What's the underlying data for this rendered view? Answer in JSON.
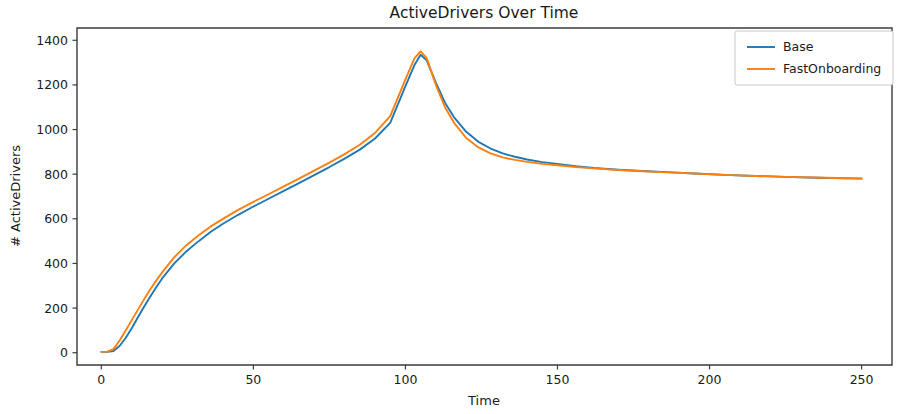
{
  "chart_data": {
    "type": "line",
    "title": "ActiveDrivers Over Time",
    "xlabel": "Time",
    "ylabel": "# ActiveDrivers",
    "xlim": [
      -8,
      260
    ],
    "ylim": [
      -55,
      1455
    ],
    "xticks": [
      0,
      50,
      100,
      150,
      200,
      250
    ],
    "xticklabels": [
      "0",
      "50",
      "100",
      "150",
      "200",
      "250"
    ],
    "yticks": [
      0,
      200,
      400,
      600,
      800,
      1000,
      1200,
      1400
    ],
    "yticklabels": [
      "0",
      "200",
      "400",
      "600",
      "800",
      "1000",
      "1200",
      "1400"
    ],
    "grid": false,
    "legend_position": "upper right",
    "legend_entries": [
      "Base",
      "FastOnboarding"
    ],
    "colors": {
      "Base": "#1f77b4",
      "FastOnboarding": "#ff7f0e"
    },
    "x": [
      0,
      2,
      4,
      6,
      8,
      10,
      12,
      14,
      16,
      18,
      20,
      24,
      28,
      32,
      36,
      40,
      45,
      50,
      55,
      60,
      65,
      70,
      75,
      80,
      85,
      90,
      95,
      100,
      103,
      105,
      107,
      110,
      113,
      116,
      120,
      124,
      128,
      132,
      136,
      140,
      145,
      150,
      156,
      162,
      170,
      178,
      186,
      195,
      205,
      215,
      225,
      235,
      245,
      250
    ],
    "series": [
      {
        "name": "Base",
        "values": [
          4,
          4,
          8,
          30,
          66,
          110,
          158,
          205,
          250,
          292,
          333,
          400,
          455,
          500,
          542,
          578,
          618,
          655,
          690,
          725,
          760,
          796,
          832,
          870,
          910,
          960,
          1030,
          1195,
          1290,
          1335,
          1310,
          1210,
          1120,
          1055,
          990,
          945,
          915,
          893,
          878,
          866,
          854,
          846,
          836,
          828,
          820,
          814,
          809,
          803,
          797,
          792,
          788,
          784,
          781,
          780
        ]
      },
      {
        "name": "FastOnboarding",
        "values": [
          4,
          5,
          16,
          55,
          100,
          146,
          192,
          238,
          282,
          322,
          360,
          428,
          482,
          526,
          566,
          600,
          640,
          676,
          710,
          745,
          780,
          816,
          852,
          890,
          932,
          985,
          1060,
          1225,
          1320,
          1350,
          1320,
          1200,
          1100,
          1030,
          962,
          920,
          893,
          875,
          864,
          855,
          846,
          840,
          832,
          826,
          819,
          813,
          808,
          803,
          797,
          792,
          788,
          785,
          782,
          781
        ]
      }
    ]
  },
  "axes_geometry": {
    "left": 77,
    "right": 892,
    "top": 28,
    "bottom": 365
  },
  "legend_geometry": {
    "x": 735,
    "y": 31,
    "width": 158,
    "height": 54
  }
}
